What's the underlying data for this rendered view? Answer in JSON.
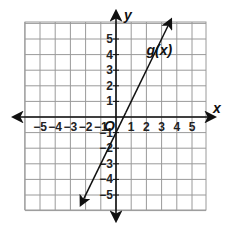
{
  "chart_data": {
    "type": "line",
    "title": "",
    "xlabel": "x",
    "ylabel": "y",
    "xlim": [
      -6,
      6
    ],
    "ylim": [
      -6,
      6
    ],
    "grid": true,
    "x_ticks": [
      -5,
      -4,
      -3,
      -2,
      -1,
      1,
      2,
      3,
      4,
      5
    ],
    "y_ticks": [
      -5,
      -4,
      -3,
      -2,
      -1,
      1,
      2,
      3,
      4,
      5
    ],
    "x_tick_labels": [
      "−5",
      "−4",
      "−3",
      "−2",
      "−1",
      "1",
      "2",
      "3",
      "4",
      "5"
    ],
    "y_tick_labels": [
      "−5",
      "−4",
      "−3",
      "−2",
      "−1",
      "1",
      "2",
      "3",
      "4",
      "5"
    ],
    "origin_label": "O",
    "series": [
      {
        "name": "g(x)",
        "equation": "y = 2x - 1",
        "slope": 2,
        "intercept": -1,
        "x": [
          -2.3,
          0,
          0.5,
          1,
          2,
          3.6
        ],
        "y": [
          -5.6,
          -1,
          0,
          1,
          3,
          6.2
        ]
      }
    ],
    "annotations": [
      {
        "text": "g(x)",
        "x": 2.2,
        "y": 4.2
      }
    ]
  }
}
